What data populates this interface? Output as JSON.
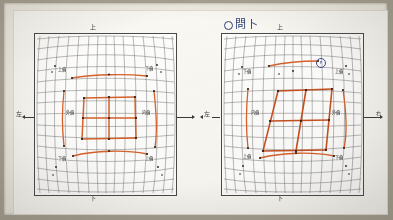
{
  "document": {
    "title": "Lens distortion grid comparison — annotated scan",
    "media": "photographed notebook page",
    "paper_color": "#fbfaf6",
    "mount_color": "#efece3",
    "background_color": "#a8a294"
  },
  "handwritten_note": {
    "marker": "o",
    "text": "問卜",
    "ink_color": "#2b3f7a",
    "position": "top-right above second panel"
  },
  "ink_colors": {
    "grid": "#5a5a5a",
    "overlay": "#d9622b",
    "overlay_dark": "#b8421c",
    "pen": "#2b3f7a",
    "pencil": "#1d1d1d"
  },
  "panels": [
    {
      "id": "panel-left",
      "name": "left-distortion-grid",
      "axis_labels": {
        "top": "上",
        "bottom": "下",
        "left": "左",
        "right": "右"
      },
      "grid": {
        "type": "pincushion-barrel-warp",
        "cols": 16,
        "rows": 16,
        "stroke": "#5a5a5a"
      },
      "annotations": [
        {
          "id": "tl",
          "text": "上偏",
          "x_pct": 18,
          "y_pct": 17
        },
        {
          "id": "tr",
          "text": "下偏",
          "x_pct": 78,
          "y_pct": 17
        },
        {
          "id": "ml",
          "text": "外偏",
          "x_pct": 23,
          "y_pct": 49
        },
        {
          "id": "mr",
          "text": "内偏",
          "x_pct": 77,
          "y_pct": 49
        },
        {
          "id": "bl",
          "text": "下偏",
          "x_pct": 18,
          "y_pct": 82
        },
        {
          "id": "br",
          "text": "上偏",
          "x_pct": 78,
          "y_pct": 82
        }
      ],
      "overlay_shape": "upright rectangular lattice (2x2 cells) centered",
      "overlay_segments": 9
    },
    {
      "id": "panel-right",
      "name": "right-distortion-grid",
      "axis_labels": {
        "top": "上",
        "bottom": "下",
        "left": "左",
        "right": "右"
      },
      "grid": {
        "type": "pincushion-barrel-warp",
        "cols": 16,
        "rows": 16,
        "stroke": "#5a5a5a"
      },
      "annotations": [
        {
          "id": "tl",
          "text": "下偏",
          "x_pct": 18,
          "y_pct": 20
        },
        {
          "id": "tr",
          "text": "上偏",
          "x_pct": 80,
          "y_pct": 20
        },
        {
          "id": "ml",
          "text": "内偏",
          "x_pct": 23,
          "y_pct": 49
        },
        {
          "id": "mr",
          "text": "外偏",
          "x_pct": 76,
          "y_pct": 49
        },
        {
          "id": "bl",
          "text": "上偏",
          "x_pct": 18,
          "y_pct": 80
        },
        {
          "id": "br",
          "text": "下偏",
          "x_pct": 80,
          "y_pct": 80
        }
      ],
      "circle_mark": {
        "label": "P",
        "x_pct": 63,
        "y_pct": 23,
        "color": "#3b4f8a"
      },
      "overlay_shape": "sheared / skewed quadrilateral lattice (2x2 cells) centered",
      "overlay_segments": 9
    }
  ]
}
